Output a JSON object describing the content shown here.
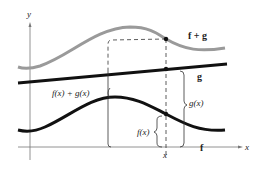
{
  "diagram": {
    "axes": {
      "x_label": "x",
      "y_label": "y"
    },
    "curves": [
      {
        "name": "f + g",
        "color": "#9a9a9a"
      },
      {
        "name": "g",
        "color": "#111111"
      },
      {
        "name": "f",
        "color": "#111111"
      }
    ],
    "labels": {
      "f_plus_g": "f + g",
      "g": "g",
      "f": "f",
      "fx_plus_gx": "f(x) + g(x)",
      "gx": "g(x)",
      "fx": "f(x)",
      "x_tick": "x"
    }
  }
}
